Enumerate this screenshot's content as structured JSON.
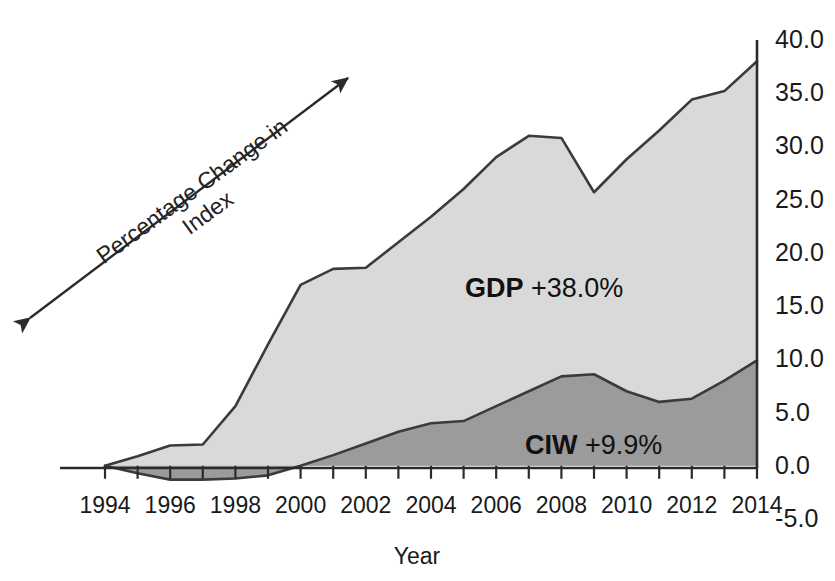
{
  "chart_data": {
    "type": "area",
    "title": "",
    "subtitle": "",
    "xlabel": "Year",
    "ylabel": "Percentage Change in Index",
    "stacked": false,
    "grid": false,
    "legend_position": "inline-annotation",
    "xlim": [
      1994,
      2014
    ],
    "ylim": [
      -5.0,
      40.0
    ],
    "x": [
      1994,
      1995,
      1996,
      1997,
      1998,
      1999,
      2000,
      2001,
      2002,
      2003,
      2004,
      2005,
      2006,
      2007,
      2008,
      2009,
      2010,
      2011,
      2012,
      2013,
      2014
    ],
    "x_tick_labels": [
      "1994",
      "1996",
      "1998",
      "2000",
      "2002",
      "2004",
      "2006",
      "2008",
      "2010",
      "2012",
      "2014"
    ],
    "x_tick_values": [
      1994,
      1996,
      1998,
      2000,
      2002,
      2004,
      2006,
      2008,
      2010,
      2012,
      2014
    ],
    "x_minor_tick_step": 1,
    "y_tick_labels": [
      "40.0",
      "35.0",
      "30.0",
      "25.0",
      "20.0",
      "15.0",
      "10.0",
      "5.0",
      "0.0",
      "-5.0"
    ],
    "y_tick_values": [
      40.0,
      35.0,
      30.0,
      25.0,
      20.0,
      15.0,
      10.0,
      5.0,
      0.0,
      -5.0
    ],
    "y_axis_side": "right",
    "series": [
      {
        "name": "GDP",
        "label": "GDP +38.0%",
        "code": "GDP",
        "change": "+38.0%",
        "fill_color": "#d9d9d9",
        "line_color": "#3b3b3b",
        "values": [
          0.0,
          0.9,
          1.9,
          2.0,
          5.6,
          11.4,
          17.0,
          18.5,
          18.6,
          21.0,
          23.4,
          26.0,
          29.0,
          31.0,
          30.8,
          25.7,
          28.8,
          31.5,
          34.4,
          35.2,
          38.0
        ]
      },
      {
        "name": "CIW",
        "label": "CIW +9.9%",
        "code": "CIW",
        "change": "+9.9%",
        "fill_color": "#9b9b9b",
        "line_color": "#3b3b3b",
        "values": [
          0.0,
          -0.7,
          -1.3,
          -1.3,
          -1.2,
          -0.9,
          0.0,
          1.0,
          2.1,
          3.2,
          4.0,
          4.2,
          5.6,
          7.0,
          8.4,
          8.6,
          7.0,
          6.0,
          6.3,
          8.0,
          9.9
        ]
      }
    ],
    "annotations": [
      {
        "id": "gdp-label",
        "text": "GDP +38.0%",
        "x_px": 465,
        "y_px": 275
      },
      {
        "id": "ciw-label",
        "text": "CIW +9.9%",
        "x_px": 525,
        "y_px": 432
      }
    ],
    "axis_arrow": {
      "id": "percentage-change-arrow",
      "label_line_1": "Percentage Change in",
      "label_line_2": "Index",
      "double_headed": true
    }
  },
  "axis": {
    "y_title_line1": "Percentage Change in",
    "y_title_line2": "Index",
    "x_title": "Year"
  }
}
